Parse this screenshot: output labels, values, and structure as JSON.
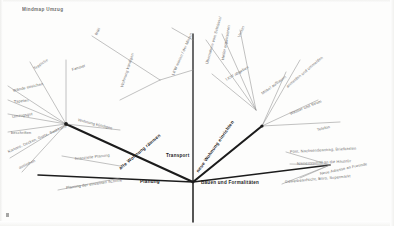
{
  "document": {
    "title": "Mindmap Umzug",
    "corner_mark": "",
    "top_notes": [
      "",
      ""
    ]
  },
  "diagram": {
    "type": "mind-map",
    "center_label": "Umzug",
    "trunk": {
      "x": 193,
      "y": 182
    }
  },
  "branches": [
    {
      "id": "transport",
      "label": "Transport",
      "x": 166,
      "y": 154,
      "rot": 0,
      "style": "main"
    },
    {
      "id": "planung",
      "label": "Planung",
      "x": 140,
      "y": 180,
      "rot": 0,
      "style": "main"
    },
    {
      "id": "bauen",
      "label": "Bauen und Formalitäten",
      "x": 201,
      "y": 181,
      "rot": 0,
      "style": "main"
    },
    {
      "id": "alte_wohnung",
      "label": "alte Wohnung räumen",
      "x": 120,
      "y": 167,
      "rot": -40,
      "style": "main"
    },
    {
      "id": "neue_wohnung",
      "label": "neue Wohnung einrichten",
      "x": 198,
      "y": 170,
      "rot": -55,
      "style": "main"
    }
  ],
  "leaves": [
    {
      "label": "Müll",
      "x": 96,
      "y": 33,
      "rot": -62,
      "style": "norm"
    },
    {
      "label": "Fenster",
      "x": 72,
      "y": 68,
      "rot": -18,
      "style": "norm"
    },
    {
      "label": "Teppiche",
      "x": 34,
      "y": 67,
      "rot": -34,
      "style": "norm"
    },
    {
      "label": "Wände streichen",
      "x": 13,
      "y": 89,
      "rot": -13,
      "style": "norm"
    },
    {
      "label": "Tapeten",
      "x": 14,
      "y": 100,
      "rot": -6,
      "style": "norm"
    },
    {
      "label": "Umzugsgut",
      "x": 12,
      "y": 115,
      "rot": -8,
      "style": "norm"
    },
    {
      "label": "beschriften",
      "x": 11,
      "y": 131,
      "rot": 0,
      "style": "norm"
    },
    {
      "label": "Kartons, Decken, Gurte, Sackkarre",
      "x": 8,
      "y": 150,
      "rot": -24,
      "style": "norm"
    },
    {
      "label": "ausleihen",
      "x": 19,
      "y": 166,
      "rot": -24,
      "style": "norm"
    },
    {
      "label": "Wohnung kündigen",
      "x": 78,
      "y": 118,
      "rot": 14,
      "style": "norm"
    },
    {
      "label": "finanzielle Planung",
      "x": 75,
      "y": 157,
      "rot": -6,
      "style": "norm"
    },
    {
      "label": "Planung der einzelnen Schritte",
      "x": 66,
      "y": 186,
      "rot": -8,
      "style": "norm"
    },
    {
      "label": "Wohnung kündigen",
      "x": 122,
      "y": 85,
      "rot": -72,
      "style": "norm"
    },
    {
      "label": "LKW mieten / der Mieten",
      "x": 173,
      "y": 73,
      "rot": -66,
      "style": "norm"
    },
    {
      "label": "Übernahme vom Schlüssel",
      "x": 207,
      "y": 62,
      "rot": -74,
      "style": "norm"
    },
    {
      "label": "Helfer organisieren",
      "x": 223,
      "y": 58,
      "rot": -80,
      "style": "norm"
    },
    {
      "label": "Verein",
      "x": 239,
      "y": 35,
      "rot": -66,
      "style": "norm"
    },
    {
      "label": "LKW abgeben",
      "x": 226,
      "y": 78,
      "rot": -30,
      "style": "norm"
    },
    {
      "label": "Möbel aufbauen",
      "x": 262,
      "y": 92,
      "rot": -36,
      "style": "norm"
    },
    {
      "label": "anmelden und ummelden",
      "x": 287,
      "y": 85,
      "rot": -40,
      "style": "norm"
    },
    {
      "label": "Wasser und Strom",
      "x": 290,
      "y": 112,
      "rot": -22,
      "style": "norm"
    },
    {
      "label": "Telefon",
      "x": 317,
      "y": 128,
      "rot": -13,
      "style": "norm"
    },
    {
      "label": "Post, Nachsendeantrag, Briefkasten",
      "x": 290,
      "y": 150,
      "rot": -3,
      "style": "norm"
    },
    {
      "label": "Namensschild an die Haustür",
      "x": 297,
      "y": 162,
      "rot": -3,
      "style": "norm"
    },
    {
      "label": "Neue Adresse an Freunde",
      "x": 320,
      "y": 172,
      "rot": -12,
      "style": "norm"
    },
    {
      "label": "Gewerbeaufsicht, Büro, Supermarkt",
      "x": 285,
      "y": 180,
      "rot": -5,
      "style": "norm"
    }
  ],
  "colors": {
    "background": "#fdfdfc",
    "stroke_main": "#1c1c1c",
    "stroke_thin": "#8a8a8a",
    "text": "#4a4a4a"
  }
}
